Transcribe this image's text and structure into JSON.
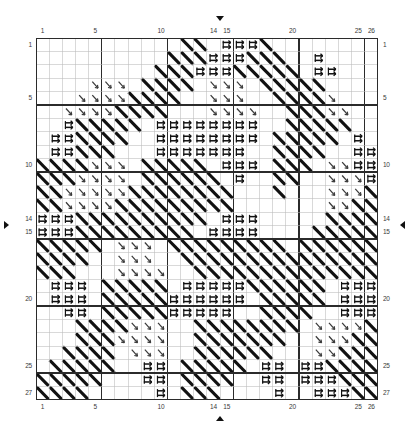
{
  "chart": {
    "type": "cross-stitch-grid",
    "columns": 26,
    "rows": 27,
    "grid": {
      "x": 36,
      "y": 38,
      "cell_w": 13.15,
      "cell_h": 13.4,
      "minor_color": "#b9b9b9",
      "major_color": "#2b2b2b",
      "major_every": 5,
      "border_color": "#2b2b2b"
    },
    "axes": {
      "top_labels": [
        "1",
        "5",
        "10",
        "14",
        "15",
        "20",
        "25",
        "26"
      ],
      "top_columns": [
        1,
        5,
        10,
        14,
        15,
        20,
        25,
        26
      ],
      "bottom_labels": [
        "1",
        "5",
        "10",
        "14",
        "15",
        "20",
        "25",
        "26"
      ],
      "bottom_columns": [
        1,
        5,
        10,
        14,
        15,
        20,
        25,
        26
      ],
      "left_labels": [
        "1",
        "5",
        "10",
        "14",
        "15",
        "20",
        "25",
        "27"
      ],
      "left_rows": [
        1,
        5,
        10,
        14,
        15,
        20,
        25,
        27
      ],
      "right_labels": [
        "1",
        "5",
        "10",
        "14",
        "15",
        "20",
        "25",
        "27"
      ],
      "right_rows": [
        1,
        5,
        10,
        14,
        15,
        20,
        25,
        27
      ]
    },
    "markers": [
      {
        "name": "center-marker-top",
        "direction": "down",
        "at_column": 14.5
      },
      {
        "name": "center-marker-bottom",
        "direction": "up",
        "at_column": 14.5
      },
      {
        "name": "center-marker-left",
        "direction": "right",
        "at_row": 14.5
      },
      {
        "name": "center-marker-right",
        "direction": "left",
        "at_row": 14.5
      }
    ],
    "symbol_legend": [
      {
        "key": "D",
        "name": "diagonal-stroke-symbol",
        "glyph": "\\",
        "color": "#111111",
        "description": "thick back-slash stitch"
      },
      {
        "key": "E",
        "name": "double-arrow-symbol",
        "glyph": "⇉",
        "color": "#111111",
        "description": "paired right arrows"
      },
      {
        "key": "A",
        "name": "small-arrow-symbol",
        "glyph": "↘",
        "color": "#3a3a3a",
        "description": "small down-right arrow"
      }
    ],
    "cells": [
      "...........DD.EEED........",
      "..........DDDEEEDDD..E....",
      ".........DDDEEEDDDDD.EE...",
      "....AAA.DDDD.AAA.DDDDD....",
      "...AAAADDDD..AAA..DDDDA...",
      "..AAAADDDD...AAAA..DDDAA..",
      "..EDDDDD.EEEEEEEE..DDDDD..",
      ".EEDDDD..EEEEEEEE.DDDDD.E.",
      ".EEDDD...EEEEEEE..DDDD..EE",
      "DDDDAAA.DDDDD.EEE.DDD.AAEE",
      "DDDAAAA.DDDDDD.E..DD..AAAE",
      "DDAAAAADDDDDDDD...D...AAAD",
      "DDAAAADDDDDDDDD.......AADD",
      "EEEDDDDDDDDDD.EEE.....DDDD",
      "EEEDDDDDDDDD.EEEE....DDDDD",
      "DDDDD.AAA.DDDDDDDDD.DDDDDD",
      "DDDD..AAA..DDDDDDDDDDDDDDD",
      "DDD...AAAA..DDDDDDDDDDDDDD",
      ".EEE.DDDDD.EEEEEDDDDDD.EEE",
      ".EEE.DDDDDEEEEEE.DDDDD.EEE",
      "..EE.DDDDDEEEEE..DDDD..EEE",
      "...DDDDAAA..DDDDDDDD.AAAAD",
      "...DDDAAAA..DDDDDDD..AAADD",
      "..DDDD.AAA..DDDDDD...AADDD",
      ".DDDDD..EE.DDDDD.EE.EEDDDD",
      "DDDDD...EE.DDDD..EE.EEEDDD",
      "DDDD.....E.DDD....E..EEEDD"
    ]
  }
}
